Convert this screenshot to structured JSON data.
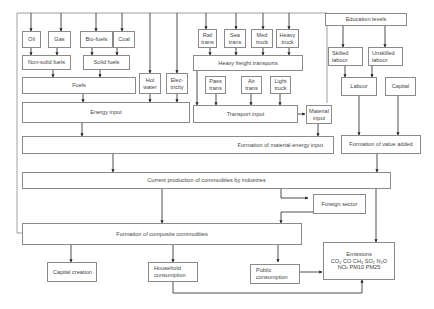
{
  "diagram": {
    "type": "flowchart",
    "nodes": {
      "oil": "Oil",
      "gas": "Gas",
      "biofuels": "Bio-fuels",
      "coal": "Coal",
      "nonsolid": "Non-solid fuels",
      "solid": "Solid fuels",
      "fuels": "Fuels",
      "hotwater": "Hot\nwater",
      "electricity": "Elec-\ntricity",
      "energy": "Energy input",
      "rail": "Rail\ntrans",
      "sea": "Sea\ntrans",
      "medtruck": "Med\ntruck",
      "heavytruck": "Heavy\ntruck",
      "heavyfreight": "Heavy freight transports",
      "pass": "Pass\ntrans",
      "air": "Air\ntrans",
      "lighttruck": "Light\ntruck",
      "transport": "Transport input",
      "material": "Material\ninput",
      "education": "Education levels",
      "skilled": "Skilled\nlabour",
      "unskilled": "Unskilled\nlabour",
      "labour": "Labour",
      "capital": "Capital",
      "matenergy": "Formation of material-energy input",
      "valueadded": "Formation of value added",
      "production": "Current production of commodities by industries",
      "foreign": "Foreign sector",
      "composite": "Formation of composite commodities",
      "capitalcreation": "Capital creation",
      "household": "Household\nconsumption",
      "public": "Public\nconsumption",
      "emissions": "Emissions\nCO₂ CO CH₄ SO₂ N₂O\nNOₓ PM10 PM25"
    },
    "edges": [
      [
        "oil",
        "nonsolid"
      ],
      [
        "gas",
        "nonsolid"
      ],
      [
        "biofuels",
        "solid"
      ],
      [
        "coal",
        "solid"
      ],
      [
        "nonsolid",
        "fuels"
      ],
      [
        "solid",
        "fuels"
      ],
      [
        "fuels",
        "energy"
      ],
      [
        "hotwater",
        "energy"
      ],
      [
        "electricity",
        "energy"
      ],
      [
        "rail",
        "heavyfreight"
      ],
      [
        "sea",
        "heavyfreight"
      ],
      [
        "medtruck",
        "heavyfreight"
      ],
      [
        "heavytruck",
        "heavyfreight"
      ],
      [
        "heavyfreight",
        "transport"
      ],
      [
        "pass",
        "transport"
      ],
      [
        "air",
        "transport"
      ],
      [
        "lighttruck",
        "transport"
      ],
      [
        "transport",
        "material"
      ],
      [
        "energy",
        "matenergy"
      ],
      [
        "material",
        "matenergy"
      ],
      [
        "education",
        "skilled"
      ],
      [
        "education",
        "unskilled"
      ],
      [
        "skilled",
        "labour"
      ],
      [
        "unskilled",
        "labour"
      ],
      [
        "labour",
        "valueadded"
      ],
      [
        "capital",
        "valueadded"
      ],
      [
        "matenergy",
        "production"
      ],
      [
        "valueadded",
        "production"
      ],
      [
        "production",
        "foreign"
      ],
      [
        "foreign",
        "composite"
      ],
      [
        "production",
        "composite"
      ],
      [
        "production",
        "emissions"
      ],
      [
        "composite",
        "capitalcreation"
      ],
      [
        "composite",
        "household"
      ],
      [
        "composite",
        "public"
      ],
      [
        "public",
        "emissions"
      ],
      [
        "household",
        "emissions"
      ]
    ]
  }
}
